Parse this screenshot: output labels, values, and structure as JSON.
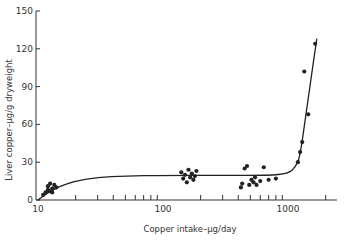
{
  "chart_data": {
    "type": "scatter",
    "title": "",
    "xlabel": "Copper intake–µg/day",
    "ylabel": "Liver copper–µg/g dryweight",
    "x_scale": "log",
    "xlim": [
      10,
      2000
    ],
    "ylim": [
      0,
      150
    ],
    "x_tick_labels": [
      "10",
      "100",
      "1000"
    ],
    "x_minor_ticks": [
      20,
      30,
      40,
      50,
      60,
      70,
      80,
      90,
      200,
      300,
      400,
      500,
      600,
      700,
      800,
      900,
      2000
    ],
    "y_ticks": [
      0,
      30,
      60,
      90,
      120,
      150
    ],
    "grid": false,
    "legend": null,
    "series": [
      {
        "name": "observations",
        "type": "scatter",
        "points": [
          {
            "x": 11,
            "y": 4
          },
          {
            "x": 11.5,
            "y": 6
          },
          {
            "x": 12,
            "y": 8
          },
          {
            "x": 12,
            "y": 11
          },
          {
            "x": 12.5,
            "y": 13
          },
          {
            "x": 13,
            "y": 9
          },
          {
            "x": 13.5,
            "y": 12
          },
          {
            "x": 13,
            "y": 6
          },
          {
            "x": 14,
            "y": 10
          },
          {
            "x": 12.5,
            "y": 7
          },
          {
            "x": 140,
            "y": 22
          },
          {
            "x": 145,
            "y": 17
          },
          {
            "x": 150,
            "y": 20
          },
          {
            "x": 155,
            "y": 14
          },
          {
            "x": 160,
            "y": 24
          },
          {
            "x": 165,
            "y": 18
          },
          {
            "x": 170,
            "y": 21
          },
          {
            "x": 175,
            "y": 16
          },
          {
            "x": 180,
            "y": 19
          },
          {
            "x": 185,
            "y": 23
          },
          {
            "x": 420,
            "y": 10
          },
          {
            "x": 430,
            "y": 13
          },
          {
            "x": 450,
            "y": 25
          },
          {
            "x": 470,
            "y": 27
          },
          {
            "x": 490,
            "y": 12
          },
          {
            "x": 510,
            "y": 16
          },
          {
            "x": 530,
            "y": 14
          },
          {
            "x": 545,
            "y": 18
          },
          {
            "x": 560,
            "y": 12
          },
          {
            "x": 600,
            "y": 15
          },
          {
            "x": 640,
            "y": 26
          },
          {
            "x": 700,
            "y": 16
          },
          {
            "x": 800,
            "y": 17
          },
          {
            "x": 1200,
            "y": 30
          },
          {
            "x": 1250,
            "y": 38
          },
          {
            "x": 1300,
            "y": 46
          },
          {
            "x": 1350,
            "y": 102
          },
          {
            "x": 1450,
            "y": 68
          },
          {
            "x": 1650,
            "y": 124
          }
        ]
      },
      {
        "name": "fitted curve",
        "type": "line",
        "points": [
          {
            "x": 10,
            "y": 0
          },
          {
            "x": 12,
            "y": 6
          },
          {
            "x": 15,
            "y": 11
          },
          {
            "x": 20,
            "y": 15
          },
          {
            "x": 30,
            "y": 18
          },
          {
            "x": 50,
            "y": 19
          },
          {
            "x": 100,
            "y": 19.5
          },
          {
            "x": 300,
            "y": 19.5
          },
          {
            "x": 700,
            "y": 19.5
          },
          {
            "x": 1000,
            "y": 21
          },
          {
            "x": 1150,
            "y": 26
          },
          {
            "x": 1250,
            "y": 35
          },
          {
            "x": 1400,
            "y": 70
          },
          {
            "x": 1700,
            "y": 128
          }
        ]
      }
    ]
  }
}
